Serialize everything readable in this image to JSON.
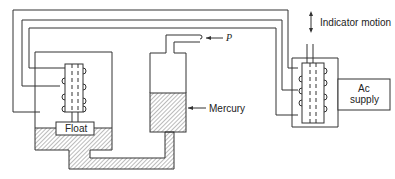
{
  "diagram": {
    "type": "mercury-manometer-with-differential-transformer",
    "labels": {
      "float": "Float",
      "mercury": "Mercury",
      "pressure": "P",
      "indicator_motion": "Indicator motion",
      "ac_supply_line1": "Ac",
      "ac_supply_line2": "supply"
    },
    "components": [
      {
        "id": "float-chamber",
        "name": "Float chamber with coil transformer"
      },
      {
        "id": "mercury-reservoir",
        "name": "Mercury column with pressure inlet P"
      },
      {
        "id": "indicator-transformer",
        "name": "Indicator coil transformer"
      },
      {
        "id": "ac-supply",
        "name": "Ac supply"
      }
    ],
    "colors": {
      "line": "#333333",
      "hatch": "#555555",
      "background": "#ffffff"
    }
  }
}
